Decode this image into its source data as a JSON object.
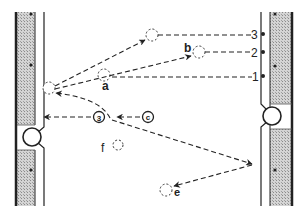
{
  "diagram": {
    "colors": {
      "ink": "#222222",
      "hatch_fill": "#c8c8c8",
      "background": "#ffffff"
    },
    "labels": {
      "a": "a",
      "b": "b",
      "e": "e",
      "f": "f",
      "circled_3": "3",
      "circled_c": "c",
      "tick_1": "1",
      "tick_2": "2",
      "tick_3": "3"
    },
    "nodes": [
      {
        "id": "left-entry",
        "x": 49,
        "y": 88
      },
      {
        "id": "top",
        "x": 152,
        "y": 35
      },
      {
        "id": "b",
        "x": 199,
        "y": 52
      },
      {
        "id": "a",
        "x": 104,
        "y": 75
      },
      {
        "id": "f",
        "x": 118,
        "y": 145
      },
      {
        "id": "e",
        "x": 166,
        "y": 190
      },
      {
        "id": "circled-3",
        "x": 99,
        "y": 117
      },
      {
        "id": "circled-c",
        "x": 148,
        "y": 117
      }
    ],
    "right_markers": [
      {
        "label": "3",
        "y": 34
      },
      {
        "label": "2",
        "y": 52
      },
      {
        "label": "1",
        "y": 76
      }
    ]
  }
}
